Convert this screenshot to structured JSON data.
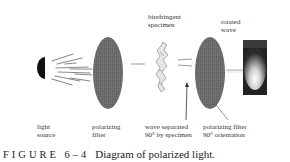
{
  "figure": {
    "label": "FIGURE 6–4",
    "title": "Diagram of polarized light."
  },
  "components": [
    {
      "id": "light-source",
      "label_line1": "light",
      "label_line2": "source"
    },
    {
      "id": "polarizing-filter",
      "label_line1": "polarizing",
      "label_line2": "filter"
    },
    {
      "id": "birefringent-specimen",
      "label_line1": "birefringent",
      "label_line2": "specimen"
    },
    {
      "id": "wave-separated",
      "label_line1": "wave separated",
      "label_line2": "90° by specimen"
    },
    {
      "id": "polarizing-filter-90",
      "label_line1": "polarizing filter",
      "label_line2": "90° orientation"
    },
    {
      "id": "rotated-wave",
      "label_line1": "rotated",
      "label_line2": "wave"
    }
  ],
  "colors": {
    "filter": "#6e6e6e",
    "source": "#111111",
    "rays": "#888888",
    "specimen": "#999999",
    "background": "#ffffff"
  }
}
